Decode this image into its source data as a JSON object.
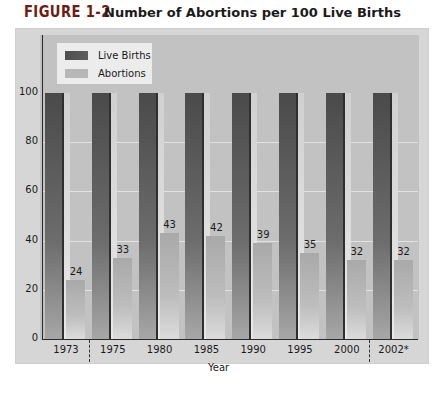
{
  "figure": {
    "label": "FIGURE 1-2",
    "title": "Number of Abortions per 100 Live Births"
  },
  "legend": {
    "items": [
      {
        "label": "Live Births",
        "color": "#555555"
      },
      {
        "label": "Abortions",
        "color": "#b7b7b7"
      }
    ]
  },
  "axes": {
    "xlabel": "Year",
    "yticks": [
      "0",
      "20",
      "40",
      "60",
      "80",
      "100"
    ]
  },
  "chart_data": {
    "type": "bar",
    "title": "Number of Abortions per 100 Live Births",
    "xlabel": "Year",
    "ylabel": "",
    "ylim": [
      0,
      100
    ],
    "grid": true,
    "legend_position": "top-left",
    "categories": [
      "1973",
      "1975",
      "1980",
      "1985",
      "1990",
      "1995",
      "2000",
      "2002*"
    ],
    "series": [
      {
        "name": "Live Births",
        "values": [
          100,
          100,
          100,
          100,
          100,
          100,
          100,
          100
        ]
      },
      {
        "name": "Abortions",
        "values": [
          24,
          33,
          43,
          42,
          39,
          35,
          32,
          32
        ]
      }
    ],
    "data_labels": [
      "24",
      "33",
      "43",
      "42",
      "39",
      "35",
      "32",
      "32"
    ],
    "annotations": [
      "dashed separator between 1973 and 1975",
      "dashed separator between 2000 and 2002*"
    ]
  }
}
